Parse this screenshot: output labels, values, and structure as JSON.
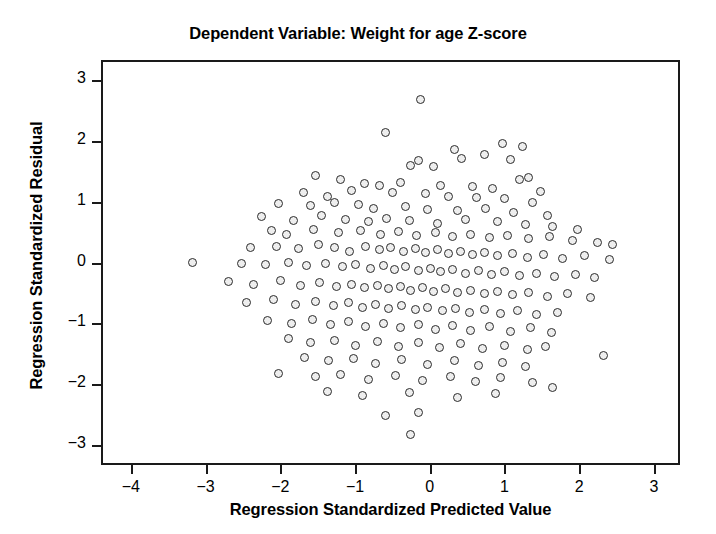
{
  "chart_data": {
    "type": "scatter",
    "title": "Dependent Variable: Weight for age Z-score",
    "xlabel": "Regression Standardized Predicted Value",
    "ylabel": "Regression Standardized Residual",
    "xlim": [
      -4.4,
      3.35
    ],
    "ylim": [
      -3.32,
      3.32
    ],
    "xticks": [
      -4,
      -3,
      -2,
      -1,
      0,
      1,
      2,
      3
    ],
    "xticklabels": [
      "-4",
      "-3",
      "-2",
      "-1",
      "0",
      "1",
      "2",
      "3"
    ],
    "yticks": [
      -3,
      -2,
      -1,
      0,
      1,
      2,
      3
    ],
    "yticklabels": [
      "-3",
      "-2",
      "-1",
      "0",
      "1",
      "2",
      "3"
    ],
    "grid": false,
    "legend": false,
    "marker": {
      "shape": "circle-open",
      "fill_color": "#eeeeee",
      "edge_color": "#2b2b2b",
      "size_px": 9
    },
    "frame_color": "#1a1a1a",
    "background_color": "#ffffff",
    "n_points": 203,
    "points": [
      [
        -0.15,
        2.7
      ],
      [
        -0.62,
        2.16
      ],
      [
        0.95,
        1.98
      ],
      [
        1.22,
        1.93
      ],
      [
        0.3,
        1.88
      ],
      [
        0.7,
        1.8
      ],
      [
        -0.18,
        1.7
      ],
      [
        0.4,
        1.74
      ],
      [
        1.06,
        1.72
      ],
      [
        -0.28,
        1.62
      ],
      [
        0.02,
        1.6
      ],
      [
        1.3,
        1.42
      ],
      [
        1.18,
        1.4
      ],
      [
        -1.55,
        1.46
      ],
      [
        -1.22,
        1.4
      ],
      [
        -0.9,
        1.33
      ],
      [
        -0.7,
        1.3
      ],
      [
        -0.42,
        1.35
      ],
      [
        0.12,
        1.3
      ],
      [
        0.55,
        1.28
      ],
      [
        0.82,
        1.24
      ],
      [
        1.45,
        1.2
      ],
      [
        -1.72,
        1.18
      ],
      [
        -1.4,
        1.12
      ],
      [
        -1.08,
        1.22
      ],
      [
        -0.52,
        1.18
      ],
      [
        -0.08,
        1.16
      ],
      [
        0.22,
        1.12
      ],
      [
        0.6,
        1.1
      ],
      [
        0.98,
        1.08
      ],
      [
        1.35,
        1.02
      ],
      [
        -2.05,
        1.0
      ],
      [
        -1.62,
        0.96
      ],
      [
        -1.3,
        1.02
      ],
      [
        -0.98,
        0.98
      ],
      [
        -0.78,
        0.92
      ],
      [
        -0.35,
        0.95
      ],
      [
        -0.05,
        0.9
      ],
      [
        0.35,
        0.88
      ],
      [
        0.72,
        0.92
      ],
      [
        1.1,
        0.86
      ],
      [
        1.55,
        0.8
      ],
      [
        -2.28,
        0.78
      ],
      [
        -1.85,
        0.72
      ],
      [
        -1.48,
        0.8
      ],
      [
        -1.15,
        0.74
      ],
      [
        -0.85,
        0.7
      ],
      [
        -0.6,
        0.76
      ],
      [
        -0.3,
        0.72
      ],
      [
        0.08,
        0.68
      ],
      [
        0.45,
        0.74
      ],
      [
        0.88,
        0.7
      ],
      [
        1.25,
        0.66
      ],
      [
        1.62,
        0.62
      ],
      [
        1.95,
        0.58
      ],
      [
        -2.15,
        0.55
      ],
      [
        -1.95,
        0.5
      ],
      [
        -1.58,
        0.58
      ],
      [
        -1.25,
        0.52
      ],
      [
        -0.95,
        0.56
      ],
      [
        -0.68,
        0.5
      ],
      [
        -0.45,
        0.54
      ],
      [
        -0.2,
        0.48
      ],
      [
        0.05,
        0.52
      ],
      [
        0.28,
        0.46
      ],
      [
        0.52,
        0.5
      ],
      [
        0.78,
        0.44
      ],
      [
        1.02,
        0.48
      ],
      [
        1.3,
        0.42
      ],
      [
        1.58,
        0.46
      ],
      [
        1.88,
        0.4
      ],
      [
        2.22,
        0.36
      ],
      [
        2.42,
        0.32
      ],
      [
        -2.42,
        0.28
      ],
      [
        -2.08,
        0.3
      ],
      [
        -1.78,
        0.26
      ],
      [
        -1.52,
        0.32
      ],
      [
        -1.3,
        0.28
      ],
      [
        -1.1,
        0.22
      ],
      [
        -0.88,
        0.3
      ],
      [
        -0.7,
        0.24
      ],
      [
        -0.55,
        0.28
      ],
      [
        -0.38,
        0.22
      ],
      [
        -0.22,
        0.26
      ],
      [
        -0.08,
        0.2
      ],
      [
        0.08,
        0.24
      ],
      [
        0.22,
        0.18
      ],
      [
        0.38,
        0.22
      ],
      [
        0.55,
        0.16
      ],
      [
        0.7,
        0.2
      ],
      [
        0.88,
        0.14
      ],
      [
        1.08,
        0.18
      ],
      [
        1.28,
        0.12
      ],
      [
        1.5,
        0.16
      ],
      [
        1.75,
        0.1
      ],
      [
        2.05,
        0.14
      ],
      [
        2.38,
        0.08
      ],
      [
        -3.2,
        0.03
      ],
      [
        -2.55,
        0.02
      ],
      [
        -2.22,
        0.0
      ],
      [
        -1.92,
        0.04
      ],
      [
        -1.68,
        -0.02
      ],
      [
        -1.42,
        0.02
      ],
      [
        -1.2,
        -0.04
      ],
      [
        -1.02,
        0.0
      ],
      [
        -0.82,
        -0.06
      ],
      [
        -0.65,
        -0.02
      ],
      [
        -0.5,
        -0.08
      ],
      [
        -0.35,
        -0.04
      ],
      [
        -0.18,
        -0.1
      ],
      [
        -0.02,
        -0.06
      ],
      [
        0.12,
        -0.12
      ],
      [
        0.28,
        -0.08
      ],
      [
        0.45,
        -0.14
      ],
      [
        0.62,
        -0.1
      ],
      [
        0.8,
        -0.16
      ],
      [
        0.98,
        -0.12
      ],
      [
        1.18,
        -0.18
      ],
      [
        1.4,
        -0.14
      ],
      [
        1.65,
        -0.2
      ],
      [
        1.92,
        -0.16
      ],
      [
        2.18,
        -0.22
      ],
      [
        -2.72,
        -0.28
      ],
      [
        -2.38,
        -0.32
      ],
      [
        -2.02,
        -0.26
      ],
      [
        -1.75,
        -0.34
      ],
      [
        -1.5,
        -0.3
      ],
      [
        -1.28,
        -0.36
      ],
      [
        -1.08,
        -0.32
      ],
      [
        -0.9,
        -0.38
      ],
      [
        -0.72,
        -0.34
      ],
      [
        -0.58,
        -0.4
      ],
      [
        -0.42,
        -0.36
      ],
      [
        -0.28,
        -0.42
      ],
      [
        -0.12,
        -0.38
      ],
      [
        0.02,
        -0.44
      ],
      [
        0.18,
        -0.4
      ],
      [
        0.35,
        -0.46
      ],
      [
        0.52,
        -0.42
      ],
      [
        0.7,
        -0.48
      ],
      [
        0.88,
        -0.44
      ],
      [
        1.08,
        -0.5
      ],
      [
        1.3,
        -0.46
      ],
      [
        1.55,
        -0.52
      ],
      [
        1.82,
        -0.48
      ],
      [
        2.12,
        -0.54
      ],
      [
        -2.48,
        -0.62
      ],
      [
        -2.12,
        -0.58
      ],
      [
        -1.82,
        -0.65
      ],
      [
        -1.55,
        -0.6
      ],
      [
        -1.32,
        -0.68
      ],
      [
        -1.12,
        -0.62
      ],
      [
        -0.92,
        -0.7
      ],
      [
        -0.75,
        -0.66
      ],
      [
        -0.58,
        -0.72
      ],
      [
        -0.4,
        -0.68
      ],
      [
        -0.22,
        -0.74
      ],
      [
        -0.05,
        -0.7
      ],
      [
        0.15,
        -0.76
      ],
      [
        0.32,
        -0.72
      ],
      [
        0.5,
        -0.78
      ],
      [
        0.7,
        -0.74
      ],
      [
        0.92,
        -0.8
      ],
      [
        1.15,
        -0.76
      ],
      [
        1.4,
        -0.82
      ],
      [
        1.68,
        -0.78
      ],
      [
        -2.2,
        -0.92
      ],
      [
        -1.88,
        -0.96
      ],
      [
        -1.6,
        -0.9
      ],
      [
        -1.35,
        -0.98
      ],
      [
        -1.12,
        -0.94
      ],
      [
        -0.88,
        -1.02
      ],
      [
        -0.65,
        -0.96
      ],
      [
        -0.42,
        -1.04
      ],
      [
        -0.18,
        -0.98
      ],
      [
        0.05,
        -1.06
      ],
      [
        0.28,
        -1.0
      ],
      [
        0.52,
        -1.08
      ],
      [
        0.78,
        -1.02
      ],
      [
        1.05,
        -1.1
      ],
      [
        1.32,
        -1.04
      ],
      [
        1.6,
        -1.12
      ],
      [
        -1.92,
        -1.22
      ],
      [
        -1.62,
        -1.28
      ],
      [
        -1.3,
        -1.24
      ],
      [
        -1.02,
        -1.32
      ],
      [
        -0.72,
        -1.26
      ],
      [
        -0.45,
        -1.34
      ],
      [
        -0.18,
        -1.28
      ],
      [
        0.1,
        -1.36
      ],
      [
        0.38,
        -1.3
      ],
      [
        0.68,
        -1.38
      ],
      [
        0.98,
        -1.32
      ],
      [
        1.28,
        -1.4
      ],
      [
        1.52,
        -1.34
      ],
      [
        2.3,
        -1.5
      ],
      [
        -1.7,
        -1.52
      ],
      [
        -1.38,
        -1.58
      ],
      [
        -1.05,
        -1.54
      ],
      [
        -0.75,
        -1.62
      ],
      [
        -0.4,
        -1.56
      ],
      [
        -0.05,
        -1.64
      ],
      [
        0.3,
        -1.58
      ],
      [
        0.62,
        -1.66
      ],
      [
        0.95,
        -1.6
      ],
      [
        1.25,
        -1.68
      ],
      [
        -2.05,
        -1.78
      ],
      [
        -1.55,
        -1.84
      ],
      [
        -1.22,
        -1.8
      ],
      [
        -0.85,
        -1.88
      ],
      [
        -0.48,
        -1.82
      ],
      [
        -0.12,
        -1.9
      ],
      [
        0.25,
        -1.84
      ],
      [
        0.58,
        -1.92
      ],
      [
        0.92,
        -1.86
      ],
      [
        1.35,
        -1.94
      ],
      [
        1.62,
        -2.02
      ],
      [
        -1.4,
        -2.08
      ],
      [
        -0.92,
        -2.14
      ],
      [
        -0.3,
        -2.1
      ],
      [
        0.35,
        -2.18
      ],
      [
        0.85,
        -2.12
      ],
      [
        -0.62,
        -2.48
      ],
      [
        -0.18,
        -2.42
      ],
      [
        -0.28,
        -2.78
      ]
    ]
  }
}
